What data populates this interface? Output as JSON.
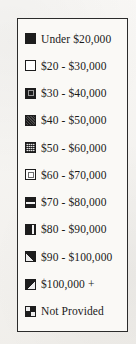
{
  "legend": {
    "title": "Income Legend",
    "frame_color": "#2b2b2b",
    "background_color": "#f4f2ee",
    "box_background": "#faf9f6",
    "text_color": "#1a1a1a",
    "items": [
      {
        "label": "Under $20,000",
        "pattern": "solid",
        "swatch_name": "swatch-under-20000"
      },
      {
        "label": "$20 - $30,000",
        "pattern": "hollow",
        "swatch_name": "swatch-20-30k"
      },
      {
        "label": "$30 - $40,000",
        "pattern": "ring",
        "swatch_name": "swatch-30-40k"
      },
      {
        "label": "$40 - $50,000",
        "pattern": "dense",
        "swatch_name": "swatch-40-50k"
      },
      {
        "label": "$50 - $60,000",
        "pattern": "stipple",
        "swatch_name": "swatch-50-60k"
      },
      {
        "label": "$60 - $70,000",
        "pattern": "light",
        "swatch_name": "swatch-60-70k"
      },
      {
        "label": "$70 - $80,000",
        "pattern": "hband",
        "swatch_name": "swatch-70-80k"
      },
      {
        "label": "$80 - $90,000",
        "pattern": "vsplit",
        "swatch_name": "swatch-80-90k"
      },
      {
        "label": "$90 - $100,000",
        "pattern": "diag1",
        "swatch_name": "swatch-90-100k"
      },
      {
        "label": "$100,000 +",
        "pattern": "diag2",
        "swatch_name": "swatch-100k-plus"
      },
      {
        "label": "Not Provided",
        "pattern": "quad",
        "swatch_name": "swatch-not-provided"
      }
    ]
  }
}
